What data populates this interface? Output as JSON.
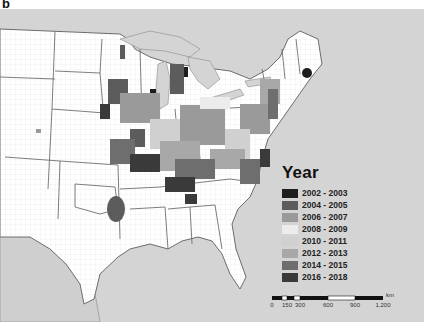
{
  "figure": {
    "panel_label": "b"
  },
  "map": {
    "region": "Eastern United States (county level)",
    "background_color": "#d4d4d4",
    "land_color": "#ffffff",
    "boundary_color": "#7a7a7a"
  },
  "legend": {
    "title": "Year",
    "items": [
      {
        "label": "2002 - 2003",
        "color": "#1e1e1e"
      },
      {
        "label": "2004 - 2005",
        "color": "#5c5c5c"
      },
      {
        "label": "2006 - 2007",
        "color": "#9a9a9a"
      },
      {
        "label": "2008 - 2009",
        "color": "#ececec"
      },
      {
        "label": "2010 - 2011",
        "color": "#d0d0d0"
      },
      {
        "label": "2012 - 2013",
        "color": "#a8a8a8"
      },
      {
        "label": "2014 - 2015",
        "color": "#6e6e6e"
      },
      {
        "label": "2016 - 2018",
        "color": "#3a3a3a"
      }
    ]
  },
  "scalebar": {
    "unit": "km",
    "ticks": [
      "0",
      "150",
      "300",
      "600",
      "900",
      "1,200"
    ]
  }
}
